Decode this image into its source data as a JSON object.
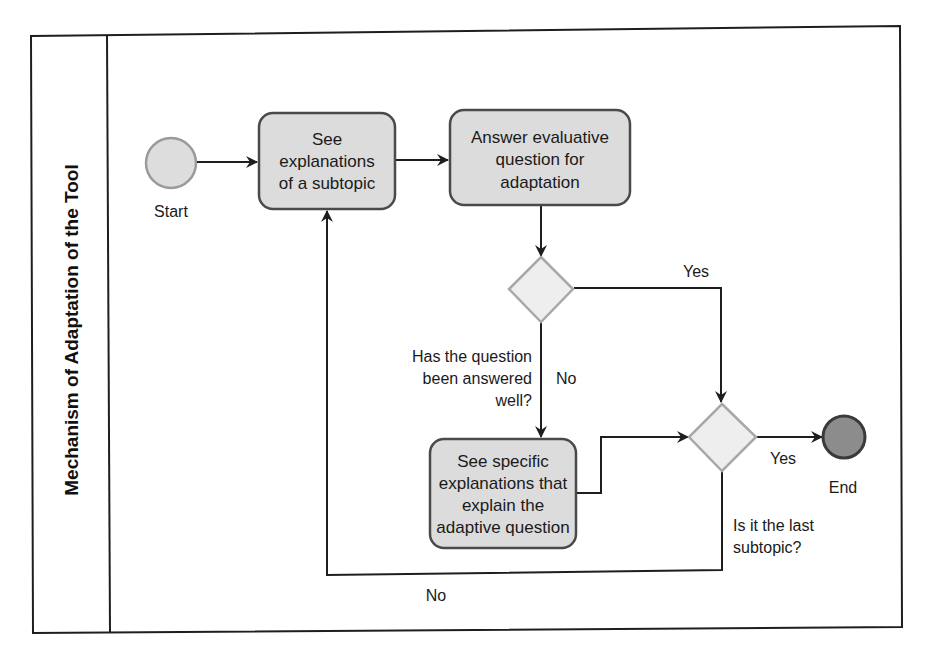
{
  "diagram": {
    "lane_title": "Mechanism of Adaptation of the Tool",
    "start": {
      "label": "Start"
    },
    "end": {
      "label": "End"
    },
    "tasks": [
      {
        "id": "see-explanations",
        "lines": [
          "See",
          "explanations",
          "of a subtopic"
        ]
      },
      {
        "id": "answer-question",
        "lines": [
          "Answer evaluative",
          "question for",
          "adaptation"
        ]
      },
      {
        "id": "see-specific",
        "lines": [
          "See specific",
          "explanations that",
          "explain the",
          "adaptive question"
        ]
      }
    ],
    "gateways": [
      {
        "id": "answered-well",
        "question_lines": [
          "Has the question",
          "been answered",
          "well?"
        ],
        "yes_label": "Yes",
        "no_label": "No"
      },
      {
        "id": "last-subtopic",
        "question_lines": [
          "Is it the last",
          "subtopic?"
        ],
        "yes_label": "Yes",
        "no_label": "No"
      }
    ],
    "colors": {
      "task_fill": "#dcdcdc",
      "task_stroke": "#4a4a4a",
      "start_fill": "#dddddd",
      "start_stroke": "#9a9a9a",
      "end_fill": "#8c8c8c",
      "end_stroke": "#3a3a3a",
      "gateway_fill": "#eeeeee",
      "gateway_stroke": "#a8a8a8",
      "line": "#1e1e1e"
    }
  }
}
